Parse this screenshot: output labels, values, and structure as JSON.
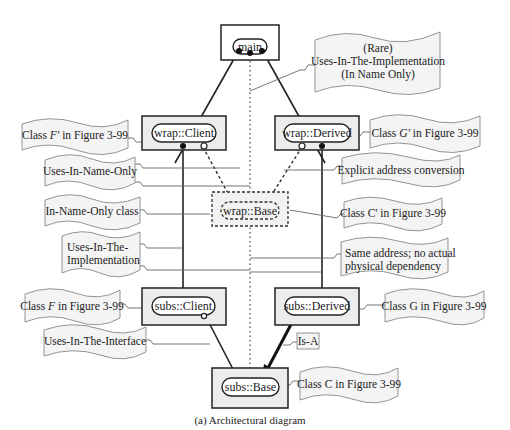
{
  "colors": {
    "box_fill": "#ececec",
    "note_fill": "#f4f4f4",
    "stroke": "#222222",
    "thin_line": "#555555"
  },
  "components": {
    "main": {
      "label": "main"
    },
    "wrap_client": {
      "label": "wrap::Client"
    },
    "wrap_derived": {
      "label": "wrap::Derived"
    },
    "wrap_base": {
      "label": "wrap::Base"
    },
    "subs_client": {
      "label": "subs::Client"
    },
    "subs_derived": {
      "label": "subs::Derived"
    },
    "subs_base": {
      "label": "subs::Base"
    }
  },
  "notes": {
    "rare": {
      "line1": "(Rare)",
      "line2": "Uses-In-The-Implementation",
      "line3": "(In Name Only)"
    },
    "class_fprime": {
      "pre": "Class ",
      "italic": "F'",
      "post": " in Figure 3-99"
    },
    "class_gprime": {
      "pre": "Class ",
      "italic": "G'",
      "post": " in Figure 3-99"
    },
    "uses_in_name_only": {
      "text": "Uses-In-Name-Only"
    },
    "explicit_address": {
      "text": "Explicit address conversion"
    },
    "in_name_only_class": {
      "text": "In-Name-Only class"
    },
    "class_cprime": {
      "text": "Class C' in Figure 3-99"
    },
    "uses_in_the_impl": {
      "line1": "Uses-In-The-",
      "line2": "Implementation"
    },
    "same_address": {
      "line1": "Same address; no actual",
      "line2": "physical dependency"
    },
    "class_f": {
      "pre": "Class ",
      "italic": "F",
      "post": " in Figure 3-99"
    },
    "class_g": {
      "text": "Class G in Figure 3-99"
    },
    "uses_in_the_interface": {
      "text": "Uses-In-The-Interface"
    },
    "is_a": {
      "text": "Is-A"
    },
    "class_c": {
      "text": "Class C in Figure 3-99"
    }
  },
  "caption": "(a) Architectural diagram"
}
